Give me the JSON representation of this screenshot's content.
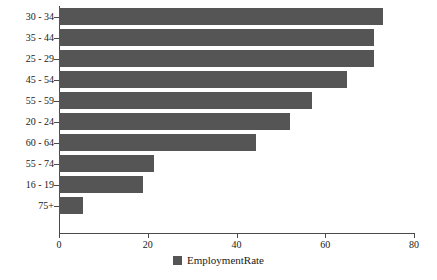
{
  "chart_data": {
    "type": "bar",
    "orientation": "horizontal",
    "title": "",
    "xlabel": "",
    "ylabel": "",
    "xlim": [
      0,
      80
    ],
    "xticks": [
      0,
      20,
      40,
      60,
      80
    ],
    "grid": false,
    "legend_position": "bottom-center",
    "series_name": "EmploymentRate",
    "bar_color": "#555555",
    "axis_color": "#4a4a4a",
    "categories": [
      "30 - 34",
      "35 - 44",
      "25 - 29",
      "45 - 54",
      "55 - 59",
      "20 - 24",
      "60 - 64",
      "55 - 74",
      "16 - 19",
      "75+"
    ],
    "values": [
      73,
      71,
      71,
      65,
      57,
      52,
      44.5,
      21.5,
      19,
      5.5
    ],
    "series": [
      {
        "name": "EmploymentRate",
        "values": [
          73,
          71,
          71,
          65,
          57,
          52,
          44.5,
          21.5,
          19,
          5.5
        ]
      }
    ]
  },
  "legend": {
    "items": [
      {
        "label": "EmploymentRate",
        "color": "#555555"
      }
    ]
  },
  "axis": {
    "x_tick_labels": [
      "0",
      "20",
      "40",
      "60",
      "80"
    ],
    "y_tick_labels": [
      "30 - 34",
      "35 - 44",
      "25 - 29",
      "45 - 54",
      "55 - 59",
      "20 - 24",
      "60 - 64",
      "55 - 74",
      "16 - 19",
      "75+"
    ]
  }
}
